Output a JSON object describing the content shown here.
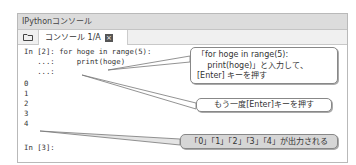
{
  "window": {
    "title": "IPythonコンソール",
    "tab": {
      "label": "コンソール 1/A",
      "close_icon": "close-icon"
    },
    "folder_icon": "folder-icon"
  },
  "console": {
    "lines": [
      "In [2]: for hoge in range(5):",
      "   ...:     print(hoge)",
      "   ...:",
      "0",
      "1",
      "2",
      "3",
      "4",
      "",
      "In [3]:"
    ]
  },
  "callouts": {
    "c1_line1": "「for hoge in range(5):",
    "c1_line2": "    print(hoge)」と入力して、",
    "c1_line3": "[Enter] キーを押す",
    "c2": "もう一度[Enter]キーを押す",
    "c3": "「0」「1」「2」「3」「4」が出力される"
  }
}
